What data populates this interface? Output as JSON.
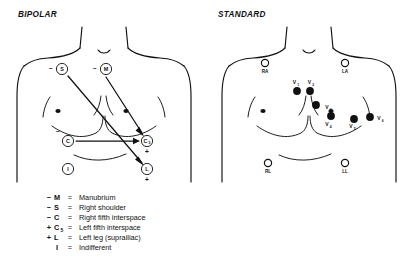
{
  "figure": {
    "background_color": "#ffffff",
    "ink_color": "#111111"
  },
  "panels": {
    "bipolar": {
      "title": "BIPOLAR",
      "electrodes": [
        {
          "id": "S",
          "label": "S",
          "subscript": "",
          "polarity": "−",
          "x": 62,
          "y": 69
        },
        {
          "id": "M",
          "label": "M",
          "subscript": "",
          "polarity": "−",
          "x": 106,
          "y": 69
        },
        {
          "id": "C",
          "label": "C",
          "subscript": "",
          "polarity": "−",
          "x": 68,
          "y": 141
        },
        {
          "id": "C5",
          "label": "C",
          "subscript": "5",
          "polarity": "+",
          "x": 147,
          "y": 141
        },
        {
          "id": "I",
          "label": "I",
          "subscript": "",
          "polarity": "",
          "x": 68,
          "y": 169
        },
        {
          "id": "L",
          "label": "L",
          "subscript": "",
          "polarity": "+",
          "x": 147,
          "y": 169
        }
      ],
      "vectors": [
        {
          "from": "S",
          "to": "L",
          "description": "Right shoulder to left leg"
        },
        {
          "from": "M",
          "to": "C5",
          "description": "Manubrium to left fifth interspace"
        },
        {
          "from": "C",
          "to": "C5",
          "description": "Right fifth interspace to left fifth interspace"
        }
      ]
    },
    "standard": {
      "title": "STANDARD",
      "limb_electrodes": [
        {
          "id": "RA",
          "label": "RA",
          "x": 265,
          "y": 63
        },
        {
          "id": "LA",
          "label": "LA",
          "x": 345,
          "y": 63
        },
        {
          "id": "RL",
          "label": "RL",
          "x": 268,
          "y": 163
        },
        {
          "id": "LL",
          "label": "LL",
          "x": 345,
          "y": 163
        }
      ],
      "precordial_electrodes": [
        {
          "id": "V1",
          "label": "V",
          "subscript": "1",
          "x": 297,
          "y": 91,
          "label_x": 296,
          "label_y": 84
        },
        {
          "id": "V2",
          "label": "V",
          "subscript": "2",
          "x": 310,
          "y": 91,
          "label_x": 311,
          "label_y": 84
        },
        {
          "id": "V3",
          "label": "V",
          "subscript": "3",
          "x": 316,
          "y": 105,
          "label_x": 330,
          "label_y": 109
        },
        {
          "id": "V4",
          "label": "V",
          "subscript": "4",
          "x": 331,
          "y": 116,
          "label_x": 329,
          "label_y": 126
        },
        {
          "id": "V5",
          "label": "V",
          "subscript": "5",
          "x": 354,
          "y": 119,
          "label_x": 353,
          "label_y": 128
        },
        {
          "id": "V6",
          "label": "V",
          "subscript": "6",
          "x": 370,
          "y": 117,
          "label_x": 382,
          "label_y": 120
        }
      ]
    }
  },
  "legend": {
    "rows": [
      {
        "sign": "−",
        "key": "M",
        "subscript": "",
        "equals": "=",
        "description": "Manubrium"
      },
      {
        "sign": "−",
        "key": "S",
        "subscript": "",
        "equals": "=",
        "description": "Right shoulder"
      },
      {
        "sign": "−",
        "key": "C",
        "subscript": "",
        "equals": "=",
        "description": "Right fifth interspace"
      },
      {
        "sign": "+",
        "key": "C",
        "subscript": "5",
        "equals": "=",
        "description": "Left fifth interspace"
      },
      {
        "sign": "+",
        "key": "L",
        "subscript": "",
        "equals": "=",
        "description": "Left leg (suprailiac)"
      },
      {
        "sign": "",
        "key": "I",
        "subscript": "",
        "equals": "=",
        "description": "Indifferent"
      }
    ]
  }
}
